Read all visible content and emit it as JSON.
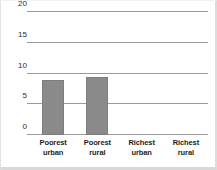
{
  "chart_data": {
    "type": "bar",
    "title": "",
    "subtitle": "",
    "xlabel": "",
    "ylabel": "",
    "categories": [
      "Poorest urban",
      "Poorest rural",
      "Richest urban",
      "Richest rural"
    ],
    "category_lines": [
      [
        "Poorest",
        "urban"
      ],
      [
        "Poorest",
        "rural"
      ],
      [
        "Richest",
        "urban"
      ],
      [
        "Richest",
        "rural"
      ]
    ],
    "values": [
      8.5,
      9.0,
      0,
      0
    ],
    "ylim": [
      0,
      20
    ],
    "yticks": [
      0,
      5,
      10,
      15,
      20
    ],
    "ytick_labels": [
      "0",
      "5",
      "10",
      "15",
      "20"
    ],
    "grid": true,
    "grid_axis": "y",
    "legend": null,
    "legend_position": "none",
    "colors": {
      "bar_fill": "#8a8a8a",
      "bar_stroke": "#7d7d7d",
      "gridline": "#9a9a9a",
      "background": "#ffffff",
      "tick_text": "#2b2b2b",
      "category_text": "#1c1c1c",
      "frame": "#dcdcdc"
    }
  }
}
